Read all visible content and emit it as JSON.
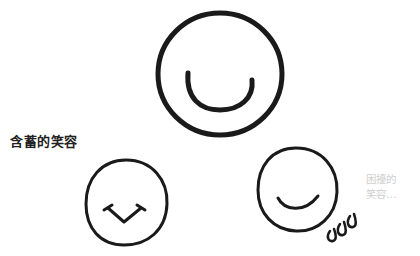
{
  "illustration": {
    "faces": [
      {
        "id": "big-smile",
        "expression": "wide-smile",
        "cx": 220,
        "cy": 72,
        "r": 63
      },
      {
        "id": "shy-smile",
        "expression": "reserved-smile",
        "cx": 126,
        "cy": 204,
        "r": 42
      },
      {
        "id": "troubled-smile",
        "expression": "awkward-smile",
        "cx": 298,
        "cy": 192,
        "r": 40
      }
    ],
    "labels": {
      "shy_smile": "含蓄的笑容",
      "troubled_smile_line1": "困擾的",
      "troubled_smile_line2": "笑容…"
    },
    "colors": {
      "ink": "#1a1a1a",
      "label_dark": "#222222",
      "label_light": "#cfcfcf",
      "background": "#ffffff"
    }
  }
}
